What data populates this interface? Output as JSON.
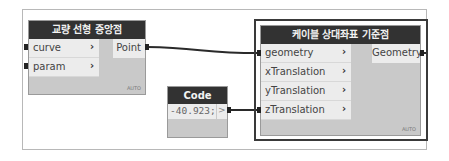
{
  "canvas": {
    "wire_color": "#2a2a2a",
    "header_color": "#323232",
    "node_body_color": "#c9c9c9"
  },
  "nodes": [
    {
      "title": "교량 선형 중앙점",
      "inputs": [
        {
          "label": "curve",
          "arrow": "›"
        },
        {
          "label": "param",
          "arrow": "›"
        }
      ],
      "outputs": [
        {
          "label": "Point"
        }
      ],
      "lacing": "AUTO"
    },
    {
      "title": "Code Block",
      "code": "-40.923;",
      "output_arrow": ">"
    },
    {
      "title": "케이블 상대좌표 기준점",
      "selected": true,
      "inputs": [
        {
          "label": "geometry",
          "arrow": "›"
        },
        {
          "label": "xTranslation",
          "arrow": "›"
        },
        {
          "label": "yTranslation",
          "arrow": "›"
        },
        {
          "label": "zTranslation",
          "arrow": "›"
        }
      ],
      "outputs": [
        {
          "label": "Geometry"
        }
      ],
      "lacing": "AUTO"
    }
  ],
  "connections": [
    {
      "from": "교량 선형 중앙점.Point",
      "to": "케이블 상대좌표 기준점.geometry"
    },
    {
      "from": "Code Block.output",
      "to": "케이블 상대좌표 기준점.zTranslation"
    }
  ]
}
